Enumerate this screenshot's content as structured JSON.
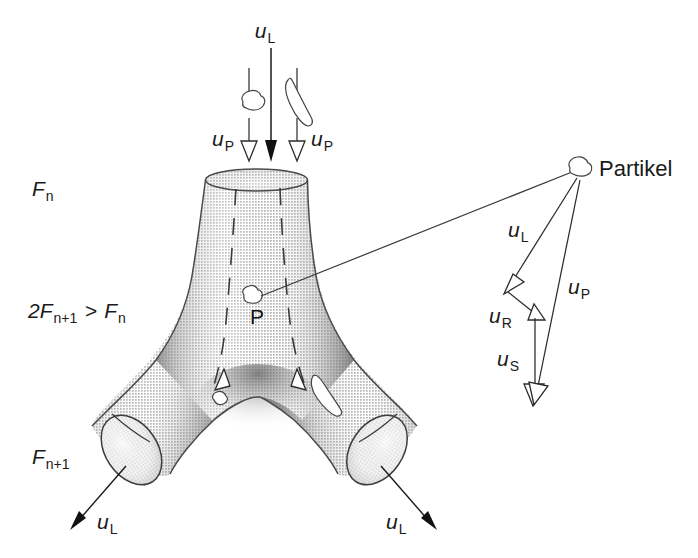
{
  "figure": {
    "background_color": "#ffffff",
    "ink_color": "#1a1a1a",
    "tube_fill_light": "#f2f2f2",
    "tube_fill_mid": "#c9c9c9",
    "tube_fill_dark": "#9a9a9a"
  },
  "inlet": {
    "flow_label": "u",
    "flow_label_sub": "L",
    "particle_label_left": "u",
    "particle_label_left_sub": "P",
    "particle_label_right": "u",
    "particle_label_right_sub": "P"
  },
  "generation_labels": {
    "upper": {
      "base": "F",
      "sub": "n"
    },
    "middle": {
      "text": "2F",
      "sub1": "n+1",
      "op": " > ",
      "text2": "F",
      "sub2": "n"
    },
    "lower": {
      "base": "F",
      "sub": "n+1"
    }
  },
  "interior": {
    "point_label": "P"
  },
  "outlets": [
    {
      "name": "left-outlet",
      "label": "u",
      "sub": "L"
    },
    {
      "name": "right-outlet",
      "label": "u",
      "sub": "L"
    }
  ],
  "callout": {
    "particle_name": "Partikel"
  },
  "vectors": [
    {
      "name": "u-L-vector",
      "label": "u",
      "sub": "L",
      "description": "Luftgeschwindigkeit"
    },
    {
      "name": "u-R-vector",
      "label": "u",
      "sub": "R",
      "description": "Relativgeschwindigkeit"
    },
    {
      "name": "u-S-vector",
      "label": "u",
      "sub": "S",
      "description": "Sedimentationsgeschwindigkeit"
    },
    {
      "name": "u-P-vector",
      "label": "u",
      "sub": "P",
      "description": "Partikelgeschwindigkeit"
    }
  ]
}
